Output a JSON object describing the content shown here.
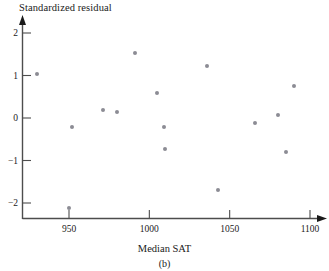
{
  "figure": {
    "panel_caption": "(b)"
  },
  "chart_data": {
    "type": "scatter",
    "title": "",
    "xlabel": "Median SAT",
    "ylabel": "Standardized residual",
    "xlim": [
      920,
      1105
    ],
    "ylim": [
      -2.45,
      2.35
    ],
    "xticks": [
      950,
      1000,
      1050,
      1100
    ],
    "xtick_labels": [
      "950",
      "1000",
      "1050",
      "1100"
    ],
    "yticks": [
      2,
      1,
      0,
      -1,
      -2
    ],
    "ytick_labels": [
      "2",
      "1",
      "0",
      "−1",
      "−2"
    ],
    "grid": false,
    "legend": null,
    "marker_color": "#8c8c94",
    "axis_color": "#4d4d4d",
    "points": [
      {
        "x": 930,
        "y": 1.04
      },
      {
        "x": 950,
        "y": -2.12
      },
      {
        "x": 952,
        "y": -0.21
      },
      {
        "x": 971,
        "y": 0.2
      },
      {
        "x": 980,
        "y": 0.13
      },
      {
        "x": 991,
        "y": 1.53
      },
      {
        "x": 1005,
        "y": 0.58
      },
      {
        "x": 1009,
        "y": -0.21
      },
      {
        "x": 1010,
        "y": -0.72
      },
      {
        "x": 1036,
        "y": 1.22
      },
      {
        "x": 1043,
        "y": -1.69
      },
      {
        "x": 1066,
        "y": -0.11
      },
      {
        "x": 1080,
        "y": 0.06
      },
      {
        "x": 1085,
        "y": -0.79
      },
      {
        "x": 1090,
        "y": 0.76
      }
    ]
  }
}
